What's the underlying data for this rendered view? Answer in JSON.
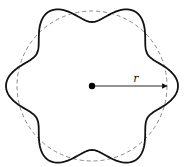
{
  "diagram": {
    "title": "",
    "center": {
      "x": 92,
      "y": 86
    },
    "reference_circle": {
      "radius": 75,
      "style": "dashed",
      "color": "#888888"
    },
    "wavy_curve": {
      "base_radius": 75,
      "amplitude": 11,
      "lobes": 6,
      "phase_deg": 0,
      "color": "#111111",
      "stroke_width": 1.8
    },
    "radius_arrow": {
      "label": "r",
      "from": "center",
      "to_angle_deg": 0
    },
    "center_dot": {
      "radius": 3.2,
      "color": "#000000"
    }
  }
}
